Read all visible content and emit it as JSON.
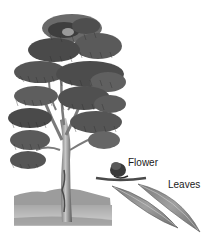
{
  "diagram": {
    "labels": [
      {
        "id": "flower",
        "text": "Flower"
      },
      {
        "id": "leaves",
        "text": "Leaves"
      }
    ],
    "colors": {
      "foliage_dark": "#3a3a3a",
      "foliage_mid": "#6a6a6a",
      "foliage_light": "#9a9a9a",
      "trunk": "#8c8c8c",
      "ground": "#b5b5b5",
      "hill": "#9f9f9f",
      "leaf": "#8a8a8a",
      "background": "#ffffff"
    }
  }
}
